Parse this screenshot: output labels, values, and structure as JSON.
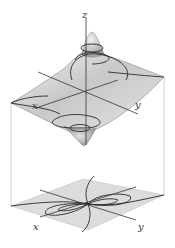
{
  "figure": {
    "surface": {
      "axis_labels": {
        "z": "z",
        "x": "x",
        "y": "y"
      }
    },
    "contour_map": {
      "axis_labels": {
        "x": "x",
        "y": "y"
      }
    },
    "colors": {
      "surface_fill": "#d4d4d4",
      "surface_dark": "#9a9a9a",
      "contour_line": "#2a2a2a",
      "plane_fill": "#dcdcdc",
      "guide_line": "#b0b0b0",
      "axis": "#333333"
    }
  }
}
